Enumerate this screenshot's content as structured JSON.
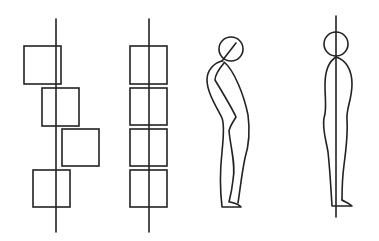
{
  "diagram": {
    "type": "posture-alignment-illustration",
    "stroke_color": "#222222",
    "background": "#ffffff",
    "panels": [
      {
        "id": "misaligned-blocks",
        "axis": {
          "x": 56,
          "y1": 19,
          "y2": 232
        },
        "blocks": [
          {
            "x": 24,
            "y": 46,
            "w": 37,
            "h": 38
          },
          {
            "x": 42,
            "y": 88,
            "w": 37,
            "h": 38
          },
          {
            "x": 62,
            "y": 129,
            "w": 37,
            "h": 37
          },
          {
            "x": 33,
            "y": 170,
            "w": 37,
            "h": 37
          }
        ]
      },
      {
        "id": "aligned-blocks",
        "axis": {
          "x": 149,
          "y1": 19,
          "y2": 232
        },
        "blocks": [
          {
            "x": 130,
            "y": 46,
            "w": 37,
            "h": 38
          },
          {
            "x": 130,
            "y": 88,
            "w": 37,
            "h": 37
          },
          {
            "x": 130,
            "y": 129,
            "w": 37,
            "h": 37
          },
          {
            "x": 130,
            "y": 170,
            "w": 37,
            "h": 37
          }
        ]
      },
      {
        "id": "stooped-figure",
        "head": {
          "cx": 231,
          "cy": 49,
          "r": 12
        }
      },
      {
        "id": "upright-figure",
        "axis": {
          "x": 336,
          "y1": 16,
          "y2": 217
        },
        "head": {
          "cx": 336,
          "cy": 44,
          "r": 12
        }
      }
    ]
  }
}
